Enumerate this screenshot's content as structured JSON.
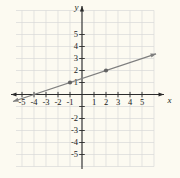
{
  "colors": {
    "background": "#fcfaf1",
    "grid": "#d9d9d9",
    "axis": "#2b2b2b",
    "text": "#1a1a1a",
    "line": "#7e7e7e",
    "point": "#636363"
  },
  "chart_data": {
    "type": "line",
    "title": "",
    "xlabel": "x",
    "ylabel": "y",
    "xlim": [
      -5.9,
      6.9
    ],
    "ylim": [
      -6.9,
      7.4
    ],
    "grid": true,
    "grid_range": {
      "x": [
        -5,
        6
      ],
      "y": [
        -6,
        7
      ]
    },
    "x_ticks": [
      -5,
      -4,
      -3,
      -2,
      -1,
      1,
      2,
      3,
      4,
      5
    ],
    "y_ticks": [
      -5,
      -4,
      -3,
      -2,
      -1,
      1,
      2,
      3,
      4,
      5
    ],
    "x_tick_labels": [
      "-5",
      "-4",
      "-3",
      "-2",
      "-1",
      "1",
      "2",
      "3",
      "4",
      "5"
    ],
    "y_tick_labels": [
      "5",
      "4",
      "3",
      "2",
      "1",
      "-2",
      "-3",
      "-4",
      "-5"
    ],
    "series": [
      {
        "name": "line",
        "equation": "y = (1/3)x + 4/3",
        "slope": 0.333333,
        "y_intercept": 1.333333,
        "x_intercept": -4,
        "x_range": [
          -5.75,
          6.17
        ],
        "points_marked": [
          {
            "x": -1,
            "y": 1
          },
          {
            "x": 2,
            "y": 2
          }
        ]
      }
    ]
  }
}
